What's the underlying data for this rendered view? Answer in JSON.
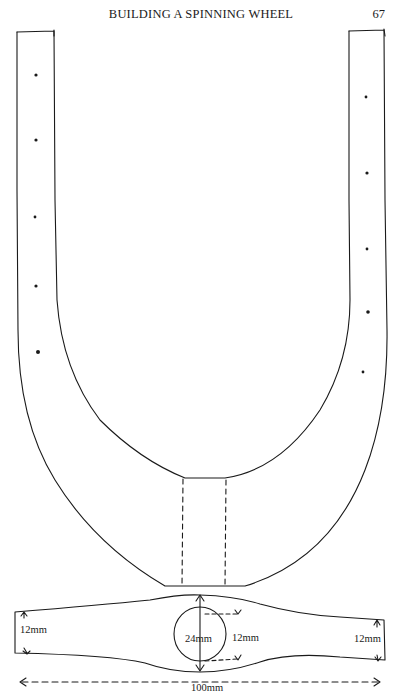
{
  "page": {
    "running_header": "BUILDING A SPINNING WHEEL",
    "page_number": "67"
  },
  "figure": {
    "labels": {
      "left_thickness": "12mm",
      "hole_diameter": "24mm",
      "side_thickness": "12mm",
      "right_thickness": "12mm",
      "overall_length": "100mm"
    },
    "dots_left_count": 5,
    "dots_right_count": 5,
    "line_color": "#1a1a1a",
    "paper_color": "#ffffff"
  }
}
